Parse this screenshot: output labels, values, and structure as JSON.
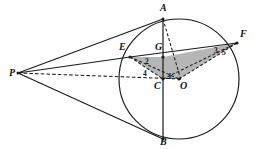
{
  "figure": {
    "canvas": {
      "width": 264,
      "height": 149
    },
    "colors": {
      "stroke": "#1a1a1a",
      "shade_fill": "#a9a9a9",
      "background": "#ffffff"
    },
    "circle": {
      "cx": 179,
      "cy": 79,
      "r": 60,
      "label": "circle-o"
    },
    "points": [
      {
        "id": "P",
        "label": "P",
        "x": 18,
        "y": 73,
        "lx": 9,
        "ly": 68
      },
      {
        "id": "A",
        "label": "A",
        "x": 163,
        "y": 19,
        "lx": 160,
        "ly": 3
      },
      {
        "id": "B",
        "label": "B",
        "x": 163,
        "y": 139,
        "lx": 160,
        "ly": 137
      },
      {
        "id": "E",
        "label": "E",
        "x": 130,
        "y": 57,
        "lx": 119,
        "ly": 42
      },
      {
        "id": "F",
        "label": "F",
        "x": 237,
        "y": 43,
        "lx": 240,
        "ly": 29
      },
      {
        "id": "G",
        "label": "G",
        "x": 163,
        "y": 57,
        "lx": 155,
        "ly": 42
      },
      {
        "id": "C",
        "label": "C",
        "x": 163,
        "y": 79,
        "lx": 155,
        "ly": 81
      },
      {
        "id": "O",
        "label": "O",
        "x": 179,
        "y": 79,
        "lx": 180,
        "ly": 81
      }
    ],
    "angle_labels": [
      {
        "id": "angle-1",
        "label": "1",
        "lx": 168,
        "ly": 73
      },
      {
        "id": "angle-2",
        "label": "2",
        "lx": 145,
        "ly": 58
      },
      {
        "id": "angle-3",
        "label": "3",
        "lx": 214,
        "ly": 47
      },
      {
        "id": "angle-4",
        "label": "4",
        "lx": 143,
        "ly": 70
      },
      {
        "id": "angle-5",
        "label": "5",
        "lx": 222,
        "ly": 49
      }
    ],
    "solid_segments": [
      {
        "id": "seg-PA",
        "from": "P",
        "to": "A",
        "desc": "tangent-from-p-to-a"
      },
      {
        "id": "seg-PB",
        "from": "P",
        "to": "B",
        "desc": "tangent-from-p-to-b"
      },
      {
        "id": "seg-PE",
        "from": "P",
        "to": "E",
        "desc": "secant-p-to-e"
      },
      {
        "id": "seg-EF",
        "from": "E",
        "to": "F",
        "desc": "chord-e-to-f"
      },
      {
        "id": "seg-AB",
        "from": "A",
        "to": "B",
        "desc": "vertical-chord-a-to-b"
      }
    ],
    "dashed_segments": [
      {
        "id": "seg-PO",
        "from": "P",
        "to": "O",
        "desc": "dashed-p-to-center-o"
      },
      {
        "id": "seg-AO",
        "from": "A",
        "to": "O",
        "desc": "dashed-a-to-center-o"
      },
      {
        "id": "seg-OF",
        "from": "O",
        "to": "F",
        "desc": "dashed-o-to-f"
      },
      {
        "id": "seg-EO",
        "from": "E",
        "to": "O",
        "desc": "dashed-e-to-o"
      },
      {
        "id": "seg-EC",
        "from": "E",
        "to": "C",
        "desc": "dashed-e-to-c"
      },
      {
        "id": "seg-CF",
        "from": "C",
        "to": "F",
        "desc": "dashed-c-to-f"
      }
    ],
    "shaded_region": {
      "id": "shaded-triangle-egf-o",
      "vertices": [
        "E",
        "G",
        "F",
        "O",
        "C"
      ],
      "desc": "grey-filled-polygon-e-g-f-o-c"
    }
  }
}
